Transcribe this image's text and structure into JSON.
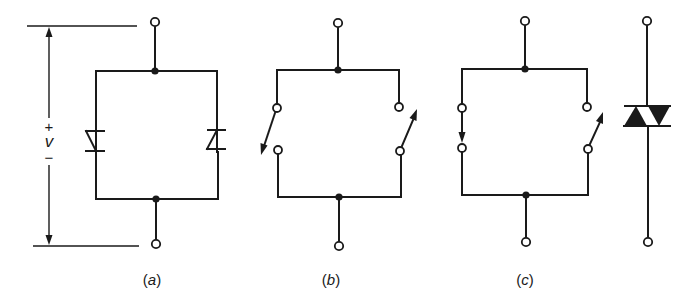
{
  "figure": {
    "subfigures": [
      {
        "id": "a",
        "label": "(a)",
        "label_letter": "a",
        "description": "Two anti-parallel Zener diodes across terminals, with voltage v indicated"
      },
      {
        "id": "b",
        "label": "(b)",
        "label_letter": "b",
        "description": "Two anti-parallel switches across terminals"
      },
      {
        "id": "c",
        "label": "(c)",
        "label_letter": "c",
        "description": "Switch pair equivalent and triac-like bidirectional symbol"
      }
    ],
    "voltage": {
      "plus": "+",
      "symbol": "v",
      "minus": "−"
    },
    "colors": {
      "line": "#1a1a1a",
      "background": "#ffffff"
    }
  }
}
